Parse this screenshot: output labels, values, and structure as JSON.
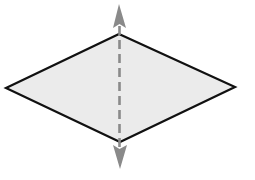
{
  "diagram": {
    "shape": {
      "type": "rhombus",
      "vertices": {
        "top": [
          119,
          34
        ],
        "right": [
          235,
          87
        ],
        "bottom": [
          120,
          142
        ],
        "left": [
          6,
          88
        ]
      },
      "fill": "#ebebeb",
      "stroke": "#111111"
    },
    "symmetry_line": {
      "orientation": "vertical",
      "style": "dashed",
      "color": "#8a8a8a",
      "top_arrow_tip": [
        119,
        5
      ],
      "bottom_arrow_tip": [
        120,
        168
      ]
    }
  }
}
